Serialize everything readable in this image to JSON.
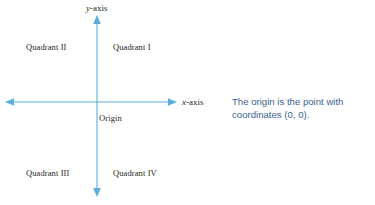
{
  "canvas": {
    "width": 375,
    "height": 205,
    "background": "#ffffff"
  },
  "colors": {
    "axis": "#5aaedd",
    "label_text": "#231f20",
    "callout_text": "#3c5f91"
  },
  "diagram": {
    "type": "cartesian-coordinate-plane",
    "origin_px": {
      "x": 97,
      "y": 102
    },
    "axes": [
      {
        "id": "x-axis",
        "label_prefix": "x",
        "label_suffix": "-axis",
        "label_full": "x-axis",
        "orientation": "horizontal",
        "arrowheads": "both",
        "start_px": {
          "x": 6,
          "y": 102
        },
        "end_px": {
          "x": 176,
          "y": 102
        }
      },
      {
        "id": "y-axis",
        "label_prefix": "y",
        "label_suffix": "-axis",
        "label_full": "y-axis",
        "orientation": "vertical",
        "arrowheads": "both",
        "start_px": {
          "x": 97,
          "y": 16
        },
        "end_px": {
          "x": 97,
          "y": 196
        }
      }
    ],
    "origin": {
      "label": "Origin"
    },
    "quadrants": [
      {
        "id": "quadrant-1",
        "label": "Quadrant I"
      },
      {
        "id": "quadrant-2",
        "label": "Quadrant II"
      },
      {
        "id": "quadrant-3",
        "label": "Quadrant III"
      },
      {
        "id": "quadrant-4",
        "label": "Quadrant IV"
      }
    ]
  },
  "callout": {
    "text": "The origin is the point with coordinates (0, 0)."
  }
}
